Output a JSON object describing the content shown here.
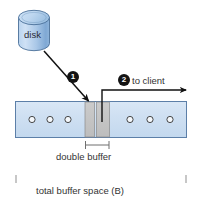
{
  "diagram": {
    "disk": {
      "label": "disk",
      "shape": "cylinder-icon",
      "fill_light": "#c8dcf2",
      "fill_dark": "#7ba7d4",
      "stroke": "#4a6f99"
    },
    "buffer_bar": {
      "fill": "#cfe0f2",
      "stroke": "#5c7fa8",
      "slot_count_left": 3,
      "slot_count_right": 3,
      "slot_glyph": "circle-icon",
      "slot_stroke": "#3a3a3a"
    },
    "double_buffer": {
      "label": "double buffer",
      "fill": "#c0c0c0",
      "stroke": "#7a7a7a",
      "segment_count": 2
    },
    "total_space": {
      "label": "total buffer space (B)"
    },
    "steps": [
      {
        "number": "1",
        "name": "disk-to-buffer-transfer",
        "label": ""
      },
      {
        "number": "2",
        "name": "buffer-to-client-transfer",
        "label": "to client"
      }
    ],
    "arrow_color": "#111111"
  }
}
